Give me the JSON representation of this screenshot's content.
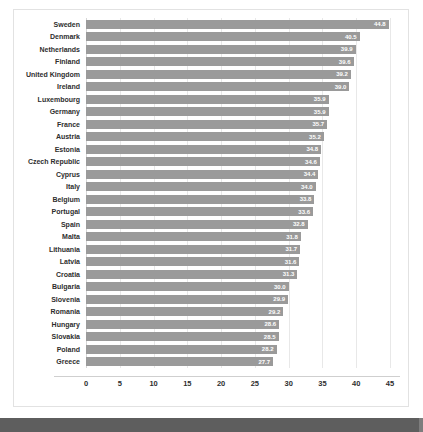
{
  "chart_data": {
    "type": "bar",
    "orientation": "horizontal",
    "title": "",
    "subtitle": "",
    "xlabel": "",
    "ylabel": "",
    "xlim": [
      0,
      45
    ],
    "grid": true,
    "legend": null,
    "xticks": [
      "0",
      "5",
      "10",
      "15",
      "20",
      "25",
      "30",
      "35",
      "40",
      "45"
    ],
    "xtick_values": [
      0,
      5,
      10,
      15,
      20,
      25,
      30,
      35,
      40,
      45
    ],
    "categories": [
      "Sweden",
      "Denmark",
      "Netherlands",
      "Finland",
      "United Kingdom",
      "Ireland",
      "Luxembourg",
      "Germany",
      "France",
      "Austria",
      "Estonia",
      "Czech Republic",
      "Cyprus",
      "Italy",
      "Belgium",
      "Portugal",
      "Spain",
      "Malta",
      "Lithuania",
      "Latvia",
      "Croatia",
      "Bulgaria",
      "Slovenia",
      "Romania",
      "Hungary",
      "Slovakia",
      "Poland",
      "Greece"
    ],
    "values": [
      44.8,
      40.5,
      39.9,
      39.6,
      39.2,
      39.0,
      35.9,
      35.9,
      35.7,
      35.2,
      34.8,
      34.6,
      34.4,
      34.0,
      33.8,
      33.6,
      32.8,
      31.8,
      31.7,
      31.6,
      31.3,
      30.0,
      29.9,
      29.2,
      28.6,
      28.5,
      28.2,
      27.7
    ],
    "value_labels": [
      "44.8",
      "40.5",
      "39.9",
      "39.6",
      "39.2",
      "39.0",
      "35.9",
      "35.9",
      "35.7",
      "35.2",
      "34.8",
      "34.6",
      "34.4",
      "34.0",
      "33.8",
      "33.6",
      "32.8",
      "31.8",
      "31.7",
      "31.6",
      "31.3",
      "30.0",
      "29.9",
      "29.2",
      "28.6",
      "28.5",
      "28.2",
      "27.7"
    ],
    "colors": {
      "bar": "#9a9a9a",
      "value_label": "#ffffff",
      "category_label": "#2e2e2e",
      "gridline": "#e8e8e8",
      "axis": "#cfcfcf",
      "plot_background": "#ffffff",
      "frame_border": "#e2e2e2",
      "footer_bar": "#5e5e5e"
    }
  }
}
